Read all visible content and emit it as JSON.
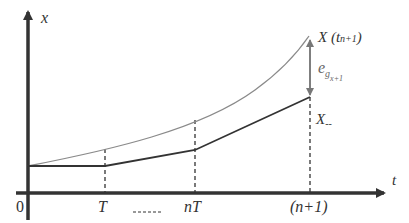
{
  "diagram": {
    "title": "",
    "axes": {
      "y_label": "x",
      "x_label": "t",
      "origin_label": "0"
    },
    "x_ticks": [
      {
        "label": "T",
        "x": 105
      },
      {
        "label": "nT",
        "x": 195
      },
      {
        "label": "(n+1)",
        "x": 310
      }
    ],
    "curves": {
      "true_state": {
        "label_main": "X (t",
        "label_sub": "n+1",
        "label_close": ")",
        "color": "#8a8a8a"
      },
      "estimate": {
        "label_main": "X",
        "label_sub": "--",
        "color": "#333333"
      }
    },
    "error": {
      "label_main": "e",
      "label_sub": "g",
      "label_subsub": "x+1"
    },
    "under_nt_dashes": "-----",
    "colors": {
      "axis": "#333333",
      "gray_curve": "#8a8a8a",
      "dark_line": "#333333"
    }
  }
}
